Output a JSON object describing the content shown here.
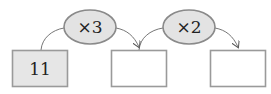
{
  "diagram": {
    "boxes": [
      {
        "id": "start",
        "value": "11",
        "filled": true
      },
      {
        "id": "middle",
        "value": "",
        "filled": false
      },
      {
        "id": "end",
        "value": "",
        "filled": false
      }
    ],
    "operations": [
      {
        "label": "×3"
      },
      {
        "label": "×2"
      }
    ],
    "colors": {
      "stroke": "#9a9a9a",
      "filled_box": "#e6e6e6",
      "empty_box": "#ffffff",
      "operation_fill": "#e3e3e3",
      "operation_stroke": "#8a8a8a",
      "arrow": "#555555"
    }
  }
}
